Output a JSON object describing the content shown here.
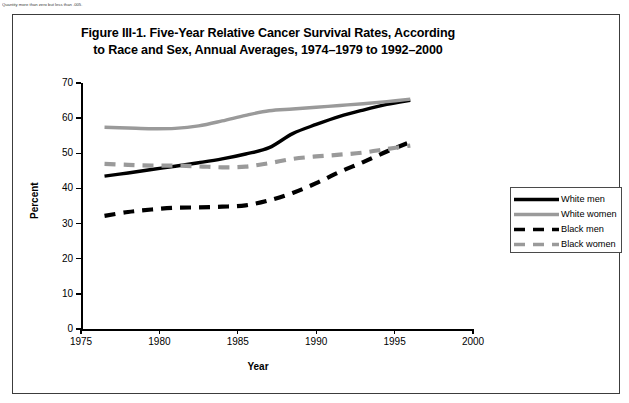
{
  "top_note": "Quantity more than zero but less than .005.",
  "figure": {
    "title_line1": "Figure III-1. Five-Year Relative Cancer Survival Rates, According",
    "title_line2": "to Race and Sex, Annual Averages, 1974–1979 to 1992–2000"
  },
  "colors": {
    "black_series": "#000000",
    "gray_series": "#9a9a9a",
    "axis": "#000000",
    "frame": "#3c3c3c"
  },
  "chart_data": {
    "type": "line",
    "title": "Figure III-1. Five-Year Relative Cancer Survival Rates, According to Race and Sex, Annual Averages, 1974–1979 to 1992–2000",
    "xlabel": "Year",
    "ylabel": "Percent",
    "xlim": [
      1975,
      2000
    ],
    "ylim": [
      0,
      70
    ],
    "xticks": [
      1975,
      1980,
      1985,
      1990,
      1995,
      2000
    ],
    "yticks": [
      0,
      10,
      20,
      30,
      40,
      50,
      60,
      70
    ],
    "grid": false,
    "legend_position": "right-outside",
    "x": [
      1976.5,
      1978,
      1979.5,
      1981,
      1982.5,
      1984,
      1985.5,
      1987,
      1988.5,
      1990,
      1991.5,
      1993,
      1994.5,
      1996
    ],
    "series": [
      {
        "name": "White men",
        "style": "solid",
        "color": "#000000",
        "values": [
          43.5,
          44.4,
          45.4,
          46.3,
          47.3,
          48.4,
          49.8,
          51.6,
          55.6,
          58.2,
          60.5,
          62.3,
          63.9,
          65.1
        ]
      },
      {
        "name": "White women",
        "style": "solid",
        "color": "#9a9a9a",
        "values": [
          57.4,
          57.2,
          57.0,
          57.1,
          57.8,
          59.2,
          60.8,
          62.1,
          62.6,
          63.1,
          63.6,
          64.1,
          64.7,
          65.4
        ]
      },
      {
        "name": "Black men",
        "style": "dashed",
        "color": "#000000",
        "values": [
          32.2,
          33.3,
          34.0,
          34.5,
          34.6,
          34.8,
          35.2,
          36.6,
          38.7,
          41.5,
          44.7,
          47.5,
          50.5,
          53.2
        ]
      },
      {
        "name": "Black women",
        "style": "dashed",
        "color": "#9a9a9a",
        "values": [
          47.0,
          46.7,
          46.5,
          46.5,
          46.3,
          46.0,
          46.2,
          47.2,
          48.4,
          49.1,
          49.6,
          50.2,
          51.2,
          52.2
        ]
      }
    ]
  },
  "legend": {
    "items": [
      {
        "label": "White men"
      },
      {
        "label": "White women"
      },
      {
        "label": "Black men"
      },
      {
        "label": "Black women"
      }
    ]
  }
}
